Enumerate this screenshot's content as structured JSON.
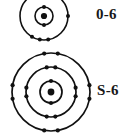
{
  "figure": {
    "background_color": "#ffffff",
    "stroke_color": "#111111",
    "atoms": [
      {
        "id": "oxygen",
        "label": "0-6",
        "nucleus_icon": "nucleus-dot",
        "center": {
          "x": 44,
          "y": 16
        },
        "shell_count": 2,
        "shells": [
          {
            "index": 1,
            "radius": 9,
            "electrons": 2,
            "angles_deg": [
              90,
              270
            ]
          },
          {
            "index": 2,
            "radius": 24,
            "electrons": 6,
            "angles_deg": [
              60,
              120,
              240,
              260,
              280,
              0
            ]
          }
        ],
        "total_electrons": 8
      },
      {
        "id": "sulfur",
        "label": "S-6",
        "nucleus_icon": "nucleus-dot",
        "center": {
          "x": 51,
          "y": 92
        },
        "shell_count": 3,
        "shells": [
          {
            "index": 1,
            "radius": 11,
            "electrons": 2,
            "angles_deg": [
              90,
              270
            ]
          },
          {
            "index": 2,
            "radius": 25,
            "electrons": 8,
            "angles_deg": [
              80,
              100,
              170,
              190,
              260,
              280,
              350,
              10
            ]
          },
          {
            "index": 3,
            "radius": 39,
            "electrons": 8,
            "angles_deg": [
              80,
              100,
              170,
              190,
              260,
              280,
              350,
              10
            ]
          }
        ],
        "total_electrons": 18
      }
    ]
  },
  "labels": {
    "oxygen_label": "0-6",
    "sulfur_label": "S-6"
  },
  "colors": {
    "ink": "#111111",
    "paper": "#ffffff",
    "text": "#181818"
  }
}
